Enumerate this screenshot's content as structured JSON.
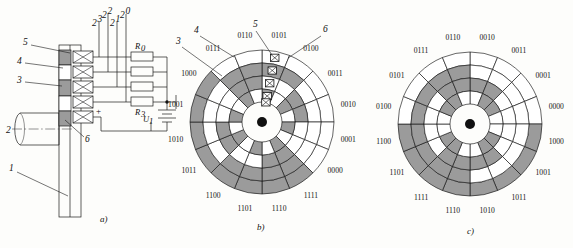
{
  "figure": {
    "captions": {
      "a": "a)",
      "b": "b)",
      "c": "c)"
    }
  },
  "panel_a": {
    "name": "encoder-brush-assembly-schematic",
    "callouts": [
      {
        "id": "1",
        "label": "1"
      },
      {
        "id": "2",
        "label": "2"
      },
      {
        "id": "3",
        "label": "3"
      },
      {
        "id": "4",
        "label": "4"
      },
      {
        "id": "5",
        "label": "5"
      },
      {
        "id": "6",
        "label": "6"
      }
    ],
    "bit_weights": [
      {
        "label": "2",
        "exp": "3"
      },
      {
        "label": "2",
        "exp": "2"
      },
      {
        "label": "2",
        "exp": "1"
      },
      {
        "label": "2",
        "exp": "0"
      }
    ],
    "resistors": [
      {
        "label": "R",
        "sub": "0"
      },
      {
        "label": "R",
        "sub": "1"
      },
      {
        "label": "R",
        "sub": "2"
      },
      {
        "label": "R",
        "sub": "3"
      }
    ],
    "resistor_visible_labels": [
      {
        "label": "R",
        "sub": "0"
      },
      {
        "label": "R",
        "sub": "3"
      }
    ],
    "source": {
      "label": "U",
      "sub": "1"
    },
    "polarity": "+",
    "contact_count": 5
  },
  "chart_data": [
    {
      "type": "polar-code-disc",
      "name": "binary-code-disc",
      "caption": "b)",
      "encoding": "natural binary",
      "tracks": 4,
      "sectors": 16,
      "msb_track": "outer",
      "bit_order_outer_to_inner": [
        "2^3",
        "2^2",
        "2^1",
        "2^0"
      ],
      "start_angle_deg": -90,
      "direction": "clockwise",
      "ring_radii": [
        20,
        33,
        46,
        59,
        72
      ],
      "hub_radius": 5,
      "colors": {
        "on": "#9b9b9b",
        "off": "#ffffff",
        "stroke": "#141414",
        "hub": "#111111"
      },
      "codes": [
        "0101",
        "0100",
        "0011",
        "0010",
        "0001",
        "0000",
        "1111",
        "1110",
        "1101",
        "1100",
        "1011",
        "1010",
        "1001",
        "1000",
        "0111",
        "0110"
      ],
      "labels": [
        "0101",
        "0100",
        "0011",
        "0010",
        "0001",
        "0000",
        "1111",
        "1110",
        "1101",
        "1100",
        "1011",
        "1010",
        "1001",
        "1000",
        "0111",
        "0110"
      ],
      "brush_count": 5,
      "callouts": [
        "3",
        "4",
        "5",
        "6"
      ]
    },
    {
      "type": "polar-code-disc",
      "name": "gray-code-disc",
      "caption": "c)",
      "encoding": "Gray code",
      "tracks": 4,
      "sectors": 16,
      "msb_track": "outer",
      "bit_order_outer_to_inner": [
        "2^3",
        "2^2",
        "2^1",
        "2^0"
      ],
      "start_angle_deg": -90,
      "direction": "clockwise",
      "ring_radii": [
        20,
        33,
        46,
        59,
        72
      ],
      "hub_radius": 5,
      "colors": {
        "on": "#9b9b9b",
        "off": "#ffffff",
        "stroke": "#141414",
        "hub": "#111111"
      },
      "codes": [
        "0010",
        "0011",
        "0001",
        "0000",
        "1000",
        "1001",
        "1011",
        "1010",
        "1110",
        "1111",
        "1101",
        "1100",
        "0100",
        "0101",
        "0111",
        "0110"
      ],
      "labels": [
        "0010",
        "0011",
        "0001",
        "0000",
        "1000",
        "1001",
        "1011",
        "1010",
        "1110",
        "1111",
        "1101",
        "1100",
        "0100",
        "0101",
        "0111",
        "0110"
      ],
      "brush_count": 0,
      "callouts": []
    }
  ]
}
